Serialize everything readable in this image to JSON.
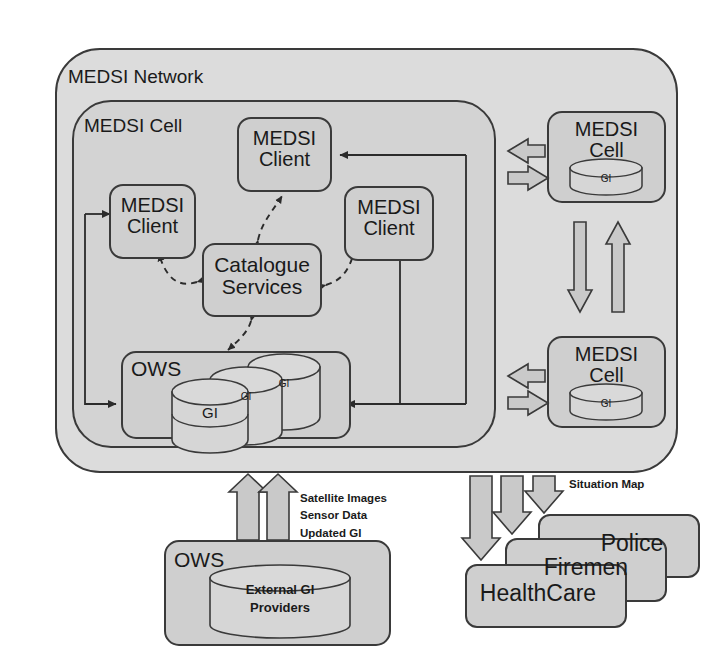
{
  "diagram": {
    "colors": {
      "network_frame_fill": "#dcdcdc",
      "cell_frame_fill": "#d2d2d2",
      "box_fill": "#cfcfcf",
      "cylinder_fill": "#d6d6d6",
      "stroke": "#3a3a3a",
      "text": "#1a1a1a",
      "arrow_block_fill": "#c9c9c9",
      "page_background": "#ffffff"
    },
    "frames": [
      {
        "id": "network",
        "label": "MEDSI Network"
      },
      {
        "id": "cell",
        "label": "MEDSI Cell"
      }
    ],
    "clients": [
      {
        "id": "client-left",
        "label": "MEDSI\nClient"
      },
      {
        "id": "client-top",
        "label": "MEDSI\nClient"
      },
      {
        "id": "client-right",
        "label": "MEDSI\nClient"
      }
    ],
    "catalogue": {
      "label": "Catalogue\nServices"
    },
    "ows_internal": {
      "title": "OWS",
      "cylinders": [
        {
          "label": "GI"
        },
        {
          "label": "GI"
        },
        {
          "label": "GI"
        }
      ]
    },
    "remote_cells": [
      {
        "id": "remote-cell-top",
        "label": "MEDSI\nCell",
        "cylinder_label": "GI"
      },
      {
        "id": "remote-cell-bottom",
        "label": "MEDSI\nCell",
        "cylinder_label": "GI"
      }
    ],
    "ows_external": {
      "title": "OWS",
      "cylinder_label": "External GI\nProviders"
    },
    "inbound_flow": {
      "caption": "Satellite Images\nSensor Data\nUpdated GI",
      "arrow_count": 2,
      "direction": "up"
    },
    "outbound_flow": {
      "caption": "Situation Map",
      "arrow_count": 3,
      "direction": "down"
    },
    "responders": [
      {
        "id": "police",
        "label": "Police"
      },
      {
        "id": "firemen",
        "label": "Firemen"
      },
      {
        "id": "healthcare",
        "label": "HealthCare"
      }
    ]
  }
}
